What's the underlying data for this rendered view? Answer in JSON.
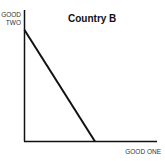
{
  "chart_data": {
    "type": "line",
    "title": "Country B",
    "xlabel": "GOOD ONE",
    "ylabel": "GOOD TWO",
    "ylabel_lines": [
      "GOOD",
      "TWO"
    ],
    "series": [
      {
        "name": "Production Possibilities Frontier",
        "points": [
          [
            0,
            1
          ],
          [
            0.53,
            0
          ]
        ]
      }
    ],
    "grid": false,
    "legend": null,
    "ticks": "none",
    "colors": {
      "line": "#111111",
      "axes": "#111111"
    }
  }
}
